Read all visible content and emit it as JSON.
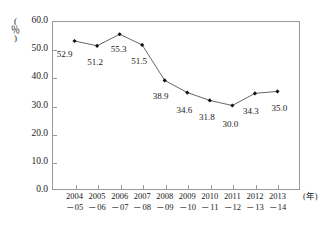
{
  "chart_data": {
    "type": "line",
    "title": "",
    "subtitle": "",
    "xlabel": "(年)",
    "ylabel": "(％)",
    "ylim": [
      0.0,
      60.0
    ],
    "ytick_step": 10.0,
    "yticks": [
      "0.0",
      "10.0",
      "20.0",
      "30.0",
      "40.0",
      "50.0",
      "60.0"
    ],
    "ytick_values": [
      0.0,
      10.0,
      20.0,
      30.0,
      40.0,
      50.0,
      60.0
    ],
    "grid": false,
    "legend": false,
    "legend_position": "none",
    "marker": "diamond",
    "line_color": "#555555",
    "marker_color": "#111111",
    "frame_color": "#9a9a9a",
    "categories": [
      "2004\n-05",
      "2005\n-06",
      "2006\n-07",
      "2007\n-08",
      "2008\n-09",
      "2009\n-10",
      "2010\n-11",
      "2011\n-12",
      "2012\n-13",
      "2013\n-14"
    ],
    "category_lines": [
      {
        "top": "2004",
        "bottom": "－05"
      },
      {
        "top": "2005",
        "bottom": "－06"
      },
      {
        "top": "2006",
        "bottom": "－07"
      },
      {
        "top": "2007",
        "bottom": "－08"
      },
      {
        "top": "2008",
        "bottom": "－09"
      },
      {
        "top": "2009",
        "bottom": "－10"
      },
      {
        "top": "2010",
        "bottom": "－11"
      },
      {
        "top": "2011",
        "bottom": "－12"
      },
      {
        "top": "2012",
        "bottom": "－13"
      },
      {
        "top": "2013",
        "bottom": "－14"
      }
    ],
    "values": [
      52.9,
      51.2,
      55.3,
      51.5,
      38.9,
      34.6,
      31.8,
      30.0,
      34.3,
      35.0
    ],
    "value_labels": [
      "52.9",
      "51.2",
      "55.3",
      "51.5",
      "38.9",
      "34.6",
      "31.8",
      "30.0",
      "34.3",
      "35.0"
    ],
    "label_offsets": [
      {
        "dx": -10,
        "dy": 9
      },
      {
        "dx": -2,
        "dy": 12
      },
      {
        "dx": -1,
        "dy": 11
      },
      {
        "dx": -3,
        "dy": 12
      },
      {
        "dx": -4,
        "dy": 12
      },
      {
        "dx": -3,
        "dy": 13
      },
      {
        "dx": -3,
        "dy": 13
      },
      {
        "dx": -2,
        "dy": 14
      },
      {
        "dx": -4,
        "dy": 14
      },
      {
        "dx": 2,
        "dy": 13
      }
    ]
  }
}
